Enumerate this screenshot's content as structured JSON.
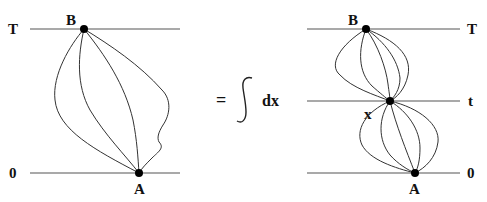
{
  "left_diagram": {
    "top_level_label": "T",
    "bottom_level_label": "0",
    "start_point_label": "B",
    "end_point_label": "A",
    "path_count": 4
  },
  "equation": {
    "equals": "=",
    "integral_symbol": "∫",
    "variable": "dx"
  },
  "right_diagram": {
    "top_level_label": "T",
    "middle_level_label": "t",
    "bottom_level_label": "0",
    "start_point_label": "B",
    "middle_point_label": "x",
    "end_point_label": "A",
    "upper_path_count": 4,
    "lower_path_count": 4
  },
  "colors": {
    "line": "#555555",
    "path": "#333333",
    "dot": "#000000",
    "text": "#111111"
  }
}
